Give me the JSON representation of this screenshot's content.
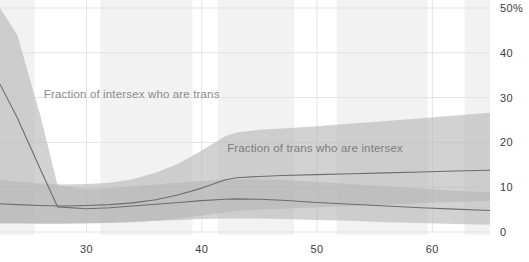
{
  "chart_data": {
    "type": "area",
    "title": "",
    "subtitle": "",
    "xlabel": "",
    "ylabel": "",
    "xlim": [
      22.5,
      65
    ],
    "ylim": [
      0,
      50
    ],
    "y_unit": "%",
    "grid": true,
    "legend": "inline-annotations",
    "x_ticks": [
      30,
      40,
      50,
      60
    ],
    "x_tick_labels": [
      "30",
      "40",
      "50",
      "60"
    ],
    "y_ticks": [
      0,
      10,
      20,
      30,
      40,
      50
    ],
    "y_tick_labels": [
      "0",
      "10",
      "20",
      "30",
      "40",
      "50%"
    ],
    "annotations": [
      {
        "name": "fraction-of-intersex-who-are-trans",
        "text": "Fraction of intersex who are trans",
        "x": 26.3,
        "y": 30.5
      },
      {
        "name": "fraction-of-trans-who-are-intersex",
        "text": "Fraction of trans who are intersex",
        "x": 42.2,
        "y": 18.5
      }
    ],
    "series": [
      {
        "name": "Fraction of intersex who are trans",
        "color": "#b3b3b3",
        "line_color": "#6f6f6f",
        "x": [
          22.5,
          24,
          26,
          27.5,
          30,
          32,
          34,
          36,
          38,
          40,
          42,
          43,
          45,
          47,
          50,
          53,
          56,
          59,
          62,
          65
        ],
        "median": [
          33.0,
          25.5,
          14.0,
          5.6,
          5.2,
          5.4,
          5.8,
          6.2,
          6.6,
          7.0,
          7.3,
          7.4,
          7.3,
          7.1,
          6.6,
          6.2,
          5.8,
          5.4,
          5.1,
          4.8
        ],
        "lower": [
          2.0,
          2.0,
          2.0,
          2.0,
          2.0,
          2.1,
          2.3,
          2.5,
          2.7,
          2.9,
          3.0,
          3.0,
          3.0,
          2.9,
          2.7,
          2.5,
          2.2,
          2.0,
          1.8,
          1.6
        ],
        "upper": [
          50.0,
          44.0,
          26.0,
          10.4,
          9.6,
          9.8,
          10.2,
          10.6,
          11.0,
          11.4,
          11.7,
          11.8,
          11.8,
          11.6,
          11.2,
          10.7,
          10.2,
          9.7,
          9.2,
          8.8
        ]
      },
      {
        "name": "Fraction of trans who are intersex",
        "color": "#b3b3b3",
        "line_color": "#6f6f6f",
        "x": [
          22.5,
          24,
          26,
          28,
          30,
          32,
          34,
          36,
          38,
          40,
          42,
          43,
          45,
          47,
          50,
          53,
          56,
          59,
          62,
          65
        ],
        "median": [
          6.3,
          6.1,
          5.9,
          5.8,
          5.9,
          6.1,
          6.5,
          7.2,
          8.3,
          9.8,
          11.6,
          12.1,
          12.4,
          12.6,
          12.8,
          13.0,
          13.2,
          13.4,
          13.6,
          13.8
        ],
        "lower": [
          1.9,
          1.9,
          1.8,
          1.8,
          1.9,
          2.0,
          2.2,
          2.5,
          3.0,
          3.6,
          4.4,
          4.7,
          5.0,
          5.2,
          5.5,
          5.8,
          6.1,
          6.4,
          6.7,
          7.0
        ],
        "upper": [
          11.6,
          11.2,
          10.8,
          10.6,
          10.7,
          11.0,
          11.8,
          13.2,
          15.3,
          18.2,
          21.3,
          22.2,
          22.8,
          23.1,
          23.6,
          24.2,
          24.8,
          25.4,
          26.0,
          26.6
        ]
      }
    ],
    "highlight_bands": [
      {
        "x0": 22.5,
        "x1": 25.5
      },
      {
        "x0": 31.2,
        "x1": 39.2
      },
      {
        "x0": 41.4,
        "x1": 48.0
      },
      {
        "x0": 51.7,
        "x1": 59.6
      },
      {
        "x0": 62.8,
        "x1": 65.0
      }
    ],
    "colors": {
      "background": "#ffffff",
      "grid": "#e3e3e3",
      "band_fill": "#b6b6b6",
      "band_overlap": "#a5a5a5",
      "line": "#6d6d6d",
      "highlight": "#f2f2f2",
      "tick_text": "#3c3c3c",
      "annotation_text": "#8b8b8b"
    }
  }
}
